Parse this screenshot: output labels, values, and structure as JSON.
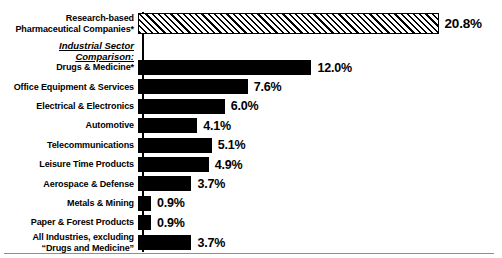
{
  "chart_data": {
    "type": "bar",
    "title": "",
    "subtitle": "",
    "xlabel": "",
    "ylabel": "",
    "orientation": "horizontal",
    "grid": false,
    "legend": "none",
    "xlim": [
      0,
      20.8
    ],
    "value_suffix": "%",
    "highlight_label": "Research-based\nPharmaceutical Companies*",
    "highlight_value": 20.8,
    "highlight_value_text": "20.8%",
    "highlight_style": "hatched",
    "section_header": "Industrial Sector Comparison:",
    "categories": [
      "Drugs & Medicine*",
      "Office Equipment & Services",
      "Electrical & Electronics",
      "Automotive",
      "Telecommunications",
      "Leisure Time Products",
      "Aerospace & Defense",
      "Metals & Mining",
      "Paper & Forest Products",
      "All Industries, excluding\n“Drugs and Medicine”"
    ],
    "values": [
      12.0,
      7.6,
      6.0,
      4.1,
      5.1,
      4.9,
      3.7,
      0.9,
      0.9,
      3.7
    ],
    "value_labels": [
      "12.0%",
      "7.6%",
      "6.0%",
      "4.1%",
      "5.1%",
      "4.9%",
      "3.7%",
      "0.9%",
      "0.9%",
      "3.7%"
    ],
    "colors": {
      "bar_fill": "#000000",
      "hatch_stroke": "#000000",
      "background": "#ffffff",
      "axis": "#000000",
      "baseline_rule": "#8e8e8e"
    }
  }
}
